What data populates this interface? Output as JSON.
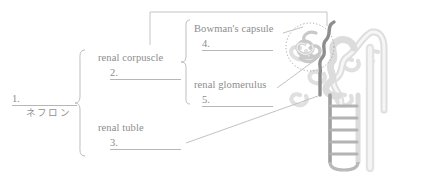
{
  "worksheet": {
    "title": "Nephron structure labeling worksheet",
    "language": "ja"
  },
  "root_term": {
    "blank_number": "1.",
    "answer_caption": "ネフロン"
  },
  "groups": [
    {
      "id": "renal-corpuscle",
      "label": "renal corpuscle",
      "blank_number": "2."
    },
    {
      "id": "renal-tuble",
      "label": "renal tuble",
      "blank_number": "3."
    }
  ],
  "subgroups": [
    {
      "id": "bowmans-capsule",
      "label": "Bowman's capsule",
      "blank_number": "4."
    },
    {
      "id": "renal-glomerulus",
      "label": "renal glomerulus",
      "blank_number": "5."
    }
  ],
  "diagram": {
    "name": "nephron-diagram",
    "parts": [
      "glomerulus",
      "bowmans-capsule-outline",
      "proximal-convoluted-tubule",
      "loop-of-henle",
      "distal-convoluted-tubule",
      "collecting-duct",
      "peritubular-capillaries"
    ]
  },
  "colors": {
    "text": "#8d8d8d",
    "rule": "#b6b6b6",
    "leader": "#c2c2c2",
    "brace": "#bdbdbd",
    "diagram_dark": "#8e8e8e",
    "diagram_light": "#d8d8d8",
    "background": "#ffffff"
  }
}
